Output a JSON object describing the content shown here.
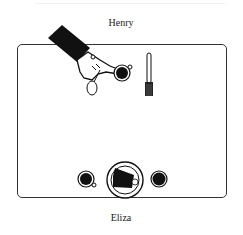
{
  "diagram": {
    "type": "table-setting-illustration",
    "top_label": "Henry",
    "bottom_label": "Eliza",
    "table": {
      "shape": "rounded-rectangle",
      "border_color": "#333333"
    },
    "top_items": [
      "hand-icon",
      "spoon-icon",
      "cup-icon",
      "fork-icon"
    ],
    "bottom_items": [
      "cup-icon",
      "plate-with-food-icon",
      "cup-icon"
    ]
  }
}
